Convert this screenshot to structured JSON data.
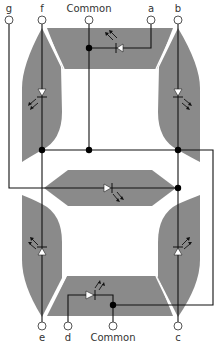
{
  "pins": {
    "top": [
      {
        "id": "g",
        "label": "g"
      },
      {
        "id": "f",
        "label": "f"
      },
      {
        "id": "common_top",
        "label": "Common"
      },
      {
        "id": "a",
        "label": "a"
      },
      {
        "id": "b",
        "label": "b"
      }
    ],
    "bottom": [
      {
        "id": "e",
        "label": "e"
      },
      {
        "id": "d",
        "label": "d"
      },
      {
        "id": "common_bottom",
        "label": "Common"
      },
      {
        "id": "c",
        "label": "c"
      }
    ]
  },
  "segments": [
    "a",
    "b",
    "c",
    "d",
    "e",
    "f",
    "g"
  ],
  "colors": {
    "segment_fill": "#8a8a8a",
    "wire": "#111111",
    "pin_fill": "#ffffff",
    "background": "#ffffff"
  }
}
